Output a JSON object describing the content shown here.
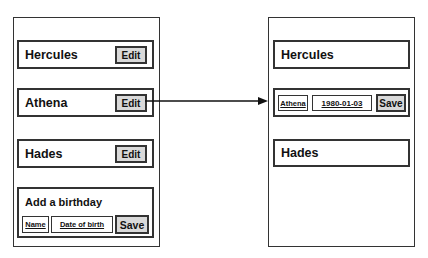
{
  "left_panel": {
    "items": [
      {
        "name": "Hercules",
        "action_label": "Edit"
      },
      {
        "name": "Athena",
        "action_label": "Edit"
      },
      {
        "name": "Hades",
        "action_label": "Edit"
      }
    ],
    "add_form": {
      "title": "Add a birthday",
      "name_placeholder": "Name",
      "dob_placeholder": "Date of birth",
      "save_label": "Save"
    }
  },
  "right_panel": {
    "items": [
      {
        "name": "Hercules"
      },
      {
        "name": "Athena",
        "editing": true,
        "dob_value": "1980-01-03",
        "save_label": "Save"
      },
      {
        "name": "Hades"
      }
    ]
  },
  "arrow": {
    "from": "left_panel.items.1.edit_button",
    "to": "right_panel.items.1",
    "color": "#111111"
  },
  "colors": {
    "border": "#333333",
    "button_fill": "#d9d9d9",
    "background": "#ffffff"
  }
}
